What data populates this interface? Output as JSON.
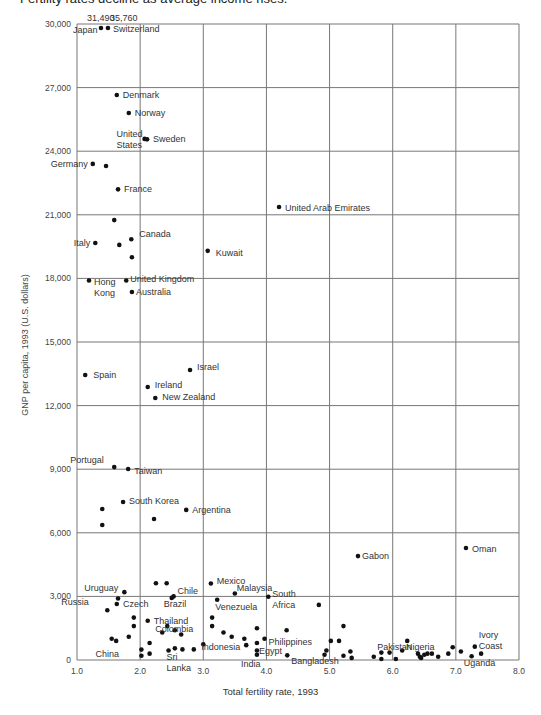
{
  "subtitle": "Fertility rates decline as average income rises.",
  "chart_data": {
    "type": "scatter",
    "title": "Fertility rates decline as average income rises.",
    "xlabel": "Total fertility rate, 1993",
    "ylabel": "GNP per capita, 1993 (U.S. dollars)",
    "xlim": [
      1.0,
      8.0
    ],
    "ylim": [
      0,
      30000
    ],
    "grid": true,
    "x_ticks": [
      "1.0",
      "2.0",
      "3.0",
      "4.0",
      "5.0",
      "6.0",
      "7.0",
      "8.0"
    ],
    "x_tick_values": [
      1,
      2,
      3,
      4,
      5,
      6,
      7,
      8
    ],
    "y_ticks": [
      "0",
      "3,000",
      "6,000",
      "9,000",
      "12,000",
      "15,000",
      "18,000",
      "21,000",
      "24,000",
      "27,000",
      "30,000"
    ],
    "y_tick_values": [
      0,
      3000,
      6000,
      9000,
      12000,
      15000,
      18000,
      21000,
      24000,
      27000,
      30000
    ],
    "annotations": [
      {
        "text": "31,490",
        "note": "Japan value above axis"
      },
      {
        "text": "35,760",
        "note": "Switzerland value above axis"
      }
    ],
    "points": [
      {
        "label": "Japan",
        "x": 1.38,
        "y": 31490,
        "offscale": true
      },
      {
        "label": "Switzerland",
        "x": 1.49,
        "y": 35760,
        "offscale": true
      },
      {
        "label": "Denmark",
        "x": 1.63,
        "y": 26650
      },
      {
        "label": "Norway",
        "x": 1.82,
        "y": 25800
      },
      {
        "label": "United States",
        "x": 2.07,
        "y": 24580
      },
      {
        "label": "Sweden",
        "x": 2.11,
        "y": 24560
      },
      {
        "label": "Germany",
        "x": 1.25,
        "y": 23400
      },
      {
        "label": "",
        "x": 1.46,
        "y": 23300
      },
      {
        "label": "France",
        "x": 1.65,
        "y": 22200
      },
      {
        "label": "",
        "x": 1.59,
        "y": 20750
      },
      {
        "label": "Italy",
        "x": 1.29,
        "y": 19670
      },
      {
        "label": "",
        "x": 1.67,
        "y": 19580
      },
      {
        "label": "Canada",
        "x": 1.86,
        "y": 19850
      },
      {
        "label": "",
        "x": 1.87,
        "y": 19000
      },
      {
        "label": "Kuwait",
        "x": 3.07,
        "y": 19300
      },
      {
        "label": "Hong Kong",
        "x": 1.19,
        "y": 17900
      },
      {
        "label": "United Kingdom",
        "x": 1.78,
        "y": 17900
      },
      {
        "label": "Australia",
        "x": 1.87,
        "y": 17360
      },
      {
        "label": "United Arab Emirates",
        "x": 4.2,
        "y": 21370
      },
      {
        "label": "Spain",
        "x": 1.13,
        "y": 13440
      },
      {
        "label": "Israel",
        "x": 2.79,
        "y": 13680
      },
      {
        "label": "Ireland",
        "x": 2.12,
        "y": 12880
      },
      {
        "label": "New Zealand",
        "x": 2.24,
        "y": 12360
      },
      {
        "label": "Portugal",
        "x": 1.59,
        "y": 9100
      },
      {
        "label": "Taiwan",
        "x": 1.81,
        "y": 9010
      },
      {
        "label": "South Korea",
        "x": 1.73,
        "y": 7450
      },
      {
        "label": "",
        "x": 1.4,
        "y": 7120
      },
      {
        "label": "",
        "x": 1.4,
        "y": 6370
      },
      {
        "label": "",
        "x": 2.22,
        "y": 6650
      },
      {
        "label": "Argentina",
        "x": 2.73,
        "y": 7080
      },
      {
        "label": "Gabon",
        "x": 5.45,
        "y": 4900
      },
      {
        "label": "Oman",
        "x": 7.16,
        "y": 5280
      },
      {
        "label": "Uruguay",
        "x": 1.75,
        "y": 3200
      },
      {
        "label": "",
        "x": 2.25,
        "y": 3620
      },
      {
        "label": "",
        "x": 2.42,
        "y": 3620
      },
      {
        "label": "Chile",
        "x": 2.53,
        "y": 3000
      },
      {
        "label": "Czech",
        "x": 1.65,
        "y": 2900
      },
      {
        "label": "",
        "x": 1.63,
        "y": 2640
      },
      {
        "label": "Brazil",
        "x": 2.5,
        "y": 2930
      },
      {
        "label": "Russia",
        "x": 1.48,
        "y": 2350
      },
      {
        "label": "",
        "x": 1.9,
        "y": 2000
      },
      {
        "label": "",
        "x": 1.9,
        "y": 1600
      },
      {
        "label": "Thailand",
        "x": 2.12,
        "y": 1850
      },
      {
        "label": "",
        "x": 2.35,
        "y": 1300
      },
      {
        "label": "",
        "x": 2.55,
        "y": 1400
      },
      {
        "label": "",
        "x": 2.65,
        "y": 1200
      },
      {
        "label": "Colombia",
        "x": 2.43,
        "y": 1600
      },
      {
        "label": "",
        "x": 1.55,
        "y": 1000
      },
      {
        "label": "",
        "x": 1.62,
        "y": 900
      },
      {
        "label": "",
        "x": 1.82,
        "y": 1100
      },
      {
        "label": "China",
        "x": 2.02,
        "y": 490
      },
      {
        "label": "",
        "x": 2.02,
        "y": 200
      },
      {
        "label": "",
        "x": 2.15,
        "y": 800
      },
      {
        "label": "",
        "x": 2.15,
        "y": 300
      },
      {
        "label": "Sri Lanka",
        "x": 2.45,
        "y": 450
      },
      {
        "label": "",
        "x": 2.55,
        "y": 550
      },
      {
        "label": "",
        "x": 2.67,
        "y": 500
      },
      {
        "label": "",
        "x": 2.85,
        "y": 500
      },
      {
        "label": "Indonesia",
        "x": 3.0,
        "y": 740
      },
      {
        "label": "Mexico",
        "x": 3.12,
        "y": 3610
      },
      {
        "label": "Malaysia",
        "x": 3.5,
        "y": 3140
      },
      {
        "label": "Venezuela",
        "x": 3.22,
        "y": 2840
      },
      {
        "label": "",
        "x": 3.14,
        "y": 2000
      },
      {
        "label": "",
        "x": 3.14,
        "y": 1600
      },
      {
        "label": "",
        "x": 3.32,
        "y": 1300
      },
      {
        "label": "",
        "x": 3.45,
        "y": 1100
      },
      {
        "label": "",
        "x": 3.65,
        "y": 1000
      },
      {
        "label": "",
        "x": 3.68,
        "y": 700
      },
      {
        "label": "",
        "x": 3.85,
        "y": 1500
      },
      {
        "label": "",
        "x": 3.85,
        "y": 800
      },
      {
        "label": "Philippines",
        "x": 3.97,
        "y": 1000
      },
      {
        "label": "Egypt",
        "x": 3.85,
        "y": 450
      },
      {
        "label": "India",
        "x": 3.85,
        "y": 250
      },
      {
        "label": "South Africa",
        "x": 4.03,
        "y": 2980
      },
      {
        "label": "",
        "x": 4.32,
        "y": 1400
      },
      {
        "label": "Bangladesh",
        "x": 4.33,
        "y": 220
      },
      {
        "label": "",
        "x": 4.83,
        "y": 2600
      },
      {
        "label": "",
        "x": 4.92,
        "y": 250
      },
      {
        "label": "",
        "x": 4.95,
        "y": 450
      },
      {
        "label": "",
        "x": 5.02,
        "y": 900
      },
      {
        "label": "",
        "x": 5.15,
        "y": 900
      },
      {
        "label": "",
        "x": 5.22,
        "y": 1600
      },
      {
        "label": "",
        "x": 5.22,
        "y": 200
      },
      {
        "label": "",
        "x": 5.33,
        "y": 400
      },
      {
        "label": "",
        "x": 5.35,
        "y": 100
      },
      {
        "label": "",
        "x": 5.7,
        "y": 150
      },
      {
        "label": "Pakistan",
        "x": 5.82,
        "y": 350
      },
      {
        "label": "",
        "x": 5.82,
        "y": 50
      },
      {
        "label": "",
        "x": 5.95,
        "y": 350
      },
      {
        "label": "",
        "x": 6.05,
        "y": 50
      },
      {
        "label": "",
        "x": 6.15,
        "y": 450
      },
      {
        "label": "",
        "x": 6.23,
        "y": 900
      },
      {
        "label": "Nigeria",
        "x": 6.4,
        "y": 300
      },
      {
        "label": "",
        "x": 6.43,
        "y": 150
      },
      {
        "label": "",
        "x": 6.45,
        "y": 100
      },
      {
        "label": "",
        "x": 6.5,
        "y": 250
      },
      {
        "label": "",
        "x": 6.55,
        "y": 300
      },
      {
        "label": "",
        "x": 6.62,
        "y": 300
      },
      {
        "label": "",
        "x": 6.72,
        "y": 150
      },
      {
        "label": "",
        "x": 6.88,
        "y": 300
      },
      {
        "label": "",
        "x": 6.95,
        "y": 600
      },
      {
        "label": "",
        "x": 7.08,
        "y": 400
      },
      {
        "label": "Ivory Coast",
        "x": 7.3,
        "y": 630
      },
      {
        "label": "Uganda",
        "x": 7.25,
        "y": 180
      },
      {
        "label": "",
        "x": 7.4,
        "y": 300
      }
    ]
  }
}
